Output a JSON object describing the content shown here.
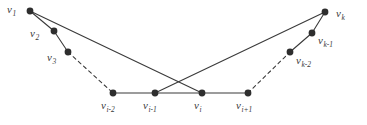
{
  "figure": {
    "width": 367,
    "height": 125,
    "background_color": "#ffffff",
    "edge_color": "#3a3a3a",
    "vertex_color": "#2e2e2e",
    "label_color": "#3a3a3a"
  },
  "graph_data": {
    "type": "diagram",
    "vertices": [
      {
        "id": "v1",
        "base": "v",
        "sub": "1",
        "x": 30,
        "y": 11,
        "label_x": 7,
        "label_y": 4,
        "r": 3.4
      },
      {
        "id": "v2",
        "base": "v",
        "sub": "2",
        "x": 54,
        "y": 31,
        "label_x": 30,
        "label_y": 28,
        "r": 3.4
      },
      {
        "id": "v3",
        "base": "v",
        "sub": "3",
        "x": 68,
        "y": 52,
        "label_x": 47,
        "label_y": 52,
        "r": 3.4
      },
      {
        "id": "vi-2",
        "base": "v",
        "sub": "i-2",
        "x": 113,
        "y": 93,
        "label_x": 101,
        "label_y": 100,
        "r": 3.4
      },
      {
        "id": "vi-1",
        "base": "v",
        "sub": "i-1",
        "x": 155,
        "y": 93,
        "label_x": 143,
        "label_y": 100,
        "r": 3.4
      },
      {
        "id": "vi",
        "base": "v",
        "sub": "i",
        "x": 202,
        "y": 93,
        "label_x": 194,
        "label_y": 100,
        "r": 3.4
      },
      {
        "id": "vi+1",
        "base": "v",
        "sub": "i+1",
        "x": 248,
        "y": 93,
        "label_x": 236,
        "label_y": 100,
        "r": 3.4
      },
      {
        "id": "vk-2",
        "base": "v",
        "sub": "k-2",
        "x": 290,
        "y": 52,
        "label_x": 296,
        "label_y": 55,
        "r": 3.4
      },
      {
        "id": "vk-1",
        "base": "v",
        "sub": "k-1",
        "x": 312,
        "y": 33,
        "label_x": 318,
        "label_y": 35,
        "r": 3.4
      },
      {
        "id": "vk",
        "base": "v",
        "sub": "k",
        "x": 325,
        "y": 12,
        "label_x": 336,
        "label_y": 8,
        "r": 3.4
      }
    ],
    "edges": [
      {
        "from": "v1",
        "to": "v2",
        "style": "solid",
        "kind": "left-chain"
      },
      {
        "from": "v2",
        "to": "v3",
        "style": "solid",
        "kind": "left-chain"
      },
      {
        "from": "v3",
        "to": "vi-2",
        "style": "dashed",
        "kind": "left-ellipsis"
      },
      {
        "from": "vi-2",
        "to": "vi-1",
        "style": "solid",
        "kind": "bottom-path"
      },
      {
        "from": "vi-1",
        "to": "vi",
        "style": "solid",
        "kind": "bottom-path"
      },
      {
        "from": "vi",
        "to": "vi+1",
        "style": "solid",
        "kind": "bottom-path"
      },
      {
        "from": "vi+1",
        "to": "vk-2",
        "style": "dashed",
        "kind": "right-ellipsis"
      },
      {
        "from": "vk-2",
        "to": "vk-1",
        "style": "solid",
        "kind": "right-chain"
      },
      {
        "from": "vk-1",
        "to": "vk",
        "style": "solid",
        "kind": "right-chain"
      },
      {
        "from": "v1",
        "to": "vi",
        "style": "solid",
        "kind": "long-crossing"
      },
      {
        "from": "vk",
        "to": "vi-1",
        "style": "solid",
        "kind": "long-crossing"
      }
    ],
    "crossing_point": {
      "x": 179,
      "y": 72
    },
    "edge_width": 1.1,
    "dash_pattern": "3.5 3.5"
  }
}
